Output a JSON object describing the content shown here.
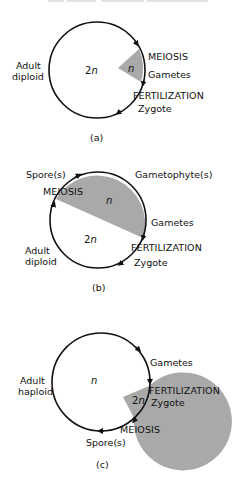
{
  "colors": {
    "haploid_fill": "#a9a9a9",
    "diploid_fill": "#ffffff",
    "stroke": "#111111"
  },
  "panels": {
    "a": {
      "caption": "(a)",
      "adult_line1": "Adult",
      "adult_line2": "diploid",
      "diploid_label_num": "2",
      "diploid_label_n": "n",
      "haploid_label": "n",
      "meiosis": "MEIOSIS",
      "gametes": "Gametes",
      "fertilization": "FERTILIZATION",
      "zygote": "Zygote"
    },
    "b": {
      "caption": "(b)",
      "spores": "Spore(s)",
      "meiosis": "MEIOSIS",
      "gametophytes": "Gametophyte(s)",
      "gametes": "Gametes",
      "fertilization": "FERTILIZATION",
      "zygote": "Zygote",
      "adult_line1": "Adult",
      "adult_line2": "diploid",
      "haploid_label": "n",
      "diploid_label_num": "2",
      "diploid_label_n": "n"
    },
    "c": {
      "caption": "(c)",
      "adult_line1": "Adult",
      "adult_line2": "haploid",
      "haploid_label": "n",
      "diploid_label_num": "2",
      "diploid_label_n": "n",
      "gametes": "Gametes",
      "fertilization": "FERTILIZATION",
      "zygote": "Zygote",
      "meiosis": "MEIOSIS",
      "spores": "Spore(s)"
    }
  }
}
